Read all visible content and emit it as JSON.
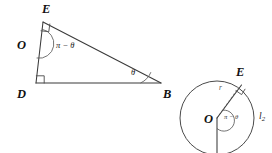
{
  "figure": {
    "background_color": "#ffffff",
    "stroke_color": "#3a3a3a",
    "width": 272,
    "height": 153
  },
  "left_diagram": {
    "name": "triangle-deb",
    "vertices": [
      {
        "id": "E",
        "label": "E",
        "x": 43,
        "y": 22,
        "label_x": 42,
        "label_y": 3
      },
      {
        "id": "O",
        "label": "O",
        "x": 36,
        "y": 45,
        "label_x": 17,
        "label_y": 39
      },
      {
        "id": "D",
        "label": "D",
        "x": 36,
        "y": 83,
        "label_x": 17,
        "label_y": 88
      },
      {
        "id": "B",
        "label": "B",
        "x": 161,
        "y": 83,
        "label_x": 163,
        "label_y": 88
      }
    ],
    "angles": [
      {
        "id": "O",
        "label": "π − θ",
        "label_x": 56,
        "label_y": 41
      },
      {
        "id": "B",
        "label": "θ",
        "label_x": 131,
        "label_y": 68
      }
    ],
    "right_angle_marks": [
      {
        "at": "E"
      },
      {
        "at": "D"
      }
    ],
    "segments": [
      {
        "from": "E",
        "to": "B",
        "style": "solid"
      },
      {
        "from": "E",
        "to": "D",
        "style": "solid"
      },
      {
        "from": "D",
        "to": "B",
        "style": "solid"
      }
    ]
  },
  "right_diagram": {
    "name": "circle-tangent",
    "center": {
      "id": "O",
      "label": "O",
      "x": 217,
      "y": 118,
      "label_x": 204,
      "label_y": 113
    },
    "radius": 37,
    "radius_label": {
      "label": "r",
      "x": 219,
      "y": 84
    },
    "point_on_circle": {
      "id": "E",
      "label": "E",
      "x": 238,
      "y": 88,
      "label_x": 236,
      "label_y": 66
    },
    "angle": {
      "label": "π − θ",
      "label_x": 224,
      "label_y": 114
    },
    "line_label": {
      "text": "l",
      "subscript": "2",
      "x": 259,
      "y": 112
    },
    "right_angle_marks": [
      {
        "at": "E"
      }
    ]
  }
}
